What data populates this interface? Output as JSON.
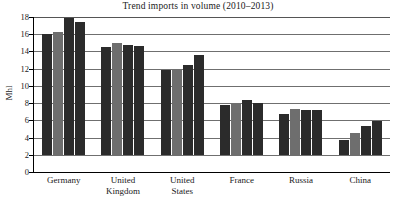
{
  "chart_data": {
    "type": "bar",
    "title": "Trend imports in volume (2010–2013)",
    "xlabel": "",
    "ylabel": "Mhl",
    "ylim": [
      0,
      18
    ],
    "ytick_step": 2,
    "yticks": [
      "0",
      "2",
      "4",
      "6",
      "8",
      "10",
      "12",
      "14",
      "16",
      "18"
    ],
    "grid": "horizontal",
    "legend": "none",
    "categories": [
      "Germany",
      "United Kingdom",
      "United States",
      "France",
      "Russia",
      "China"
    ],
    "series": [
      {
        "name": "2010",
        "values": [
          14.1,
          12.6,
          9.9,
          5.8,
          4.8,
          1.8
        ]
      },
      {
        "name": "2011",
        "values": [
          14.3,
          13.0,
          10.0,
          5.9,
          5.4,
          2.6
        ]
      },
      {
        "name": "2012",
        "values": [
          15.9,
          12.8,
          10.4,
          6.4,
          5.2,
          3.4
        ]
      },
      {
        "name": "2013",
        "values": [
          15.4,
          12.7,
          11.6,
          6.0,
          5.2,
          4.0
        ]
      }
    ],
    "series_colors": [
      "#2b2b2b",
      "#6e6e6e",
      "#2b2b2b",
      "#2b2b2b"
    ],
    "category_label_lines": [
      [
        "Germany"
      ],
      [
        "United",
        "Kingdom"
      ],
      [
        "United",
        "States"
      ],
      [
        "France"
      ],
      [
        "Russia"
      ],
      [
        "China"
      ]
    ]
  }
}
